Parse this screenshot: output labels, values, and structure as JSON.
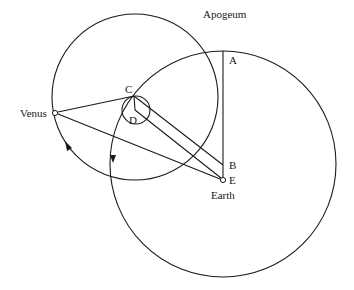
{
  "diagram": {
    "labels": {
      "apogeum": "Apogeum",
      "a": "A",
      "b": "B",
      "c": "C",
      "d": "D",
      "e": "E",
      "venus": "Venus",
      "earth": "Earth"
    },
    "points": {
      "A": [
        223,
        50
      ],
      "B": [
        223,
        165
      ],
      "C": [
        134,
        96
      ],
      "D": [
        135,
        110
      ],
      "E": [
        223,
        180
      ],
      "Venus": [
        55,
        113
      ]
    },
    "circles": {
      "epicycle": {
        "cx": 135,
        "cy": 97,
        "r": 83
      },
      "deferent": {
        "cx": 223,
        "cy": 164,
        "r": 113
      },
      "equant_small": {
        "cx": 136,
        "cy": 110,
        "r": 14
      }
    },
    "colors": {
      "line": "#1a1a1a",
      "background": "#ffffff"
    }
  }
}
